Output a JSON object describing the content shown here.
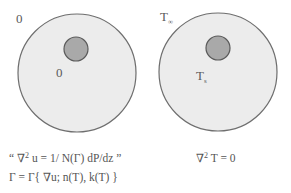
{
  "colors": {
    "outer_fill": "#ececec",
    "outer_stroke": "#6e6e6e",
    "inner_fill": "#a9a9a9",
    "inner_stroke": "#5a5a5a"
  },
  "left_panel": {
    "outer_label": "0",
    "inner_label": "0",
    "equation_line1_prefix": "“ ∇",
    "equation_line1_exp": "2",
    "equation_line1_suffix": " u = 1/ N(Γ) dP/dz ”",
    "equation_line2": "Γ = Γ{  ∇u; n(T), k(T) }"
  },
  "right_panel": {
    "outer_label_main": "T",
    "outer_label_sub": "∞",
    "inner_label_main": "T",
    "inner_label_sub": "s",
    "equation_prefix": "∇",
    "equation_exp": "2",
    "equation_suffix": " T = 0"
  }
}
